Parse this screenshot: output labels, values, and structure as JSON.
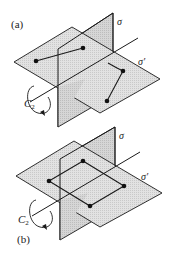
{
  "figure": {
    "panels": [
      {
        "id": "a",
        "label": "(a)",
        "plane_vertical_label": "σ",
        "plane_horizontal_label": "σ′",
        "axis_label": "C",
        "axis_subscript": "2",
        "points": [
          [
            36,
            61
          ],
          [
            83,
            48
          ],
          [
            123,
            71
          ],
          [
            107,
            101
          ]
        ],
        "connections": "two segments"
      },
      {
        "id": "b",
        "label": "(b)",
        "plane_vertical_label": "σ",
        "plane_horizontal_label": "σ′",
        "axis_label": "C",
        "axis_subscript": "2",
        "points": [
          [
            83,
            161
          ],
          [
            49,
            181
          ],
          [
            124,
            186
          ],
          [
            90,
            206
          ]
        ],
        "connections": "square"
      }
    ],
    "colors": {
      "plane_fill": "#dcdcdc",
      "plane_fill_vertical": "#cfcfcf",
      "line": "#1a1a1a",
      "background": "#ffffff"
    }
  }
}
